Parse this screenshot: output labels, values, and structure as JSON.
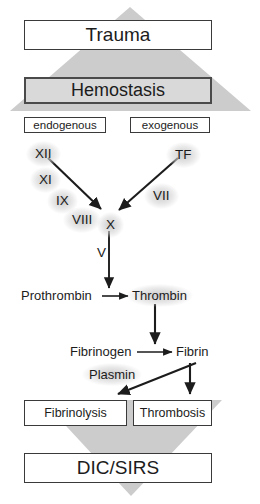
{
  "diagram": {
    "colors": {
      "triangle_fill": "#cccccc",
      "hemostasis_fill": "#d9d9d9",
      "box_border": "#3a3a3a",
      "arrow": "#1c1c1c",
      "text": "#1c1c1c",
      "glow": "#c3c3c3",
      "background": "#ffffff"
    }
  },
  "boxes": {
    "trauma": "Trauma",
    "hemostasis": "Hemostasis",
    "endogenous": "endogenous",
    "exogenous": "exogenous",
    "fibrinolysis": "Fibrinolysis",
    "thrombosis": "Thrombosis",
    "dic_sirs": "DIC/SIRS"
  },
  "factors": {
    "xii": "XII",
    "xi": "XI",
    "ix": "IX",
    "viii": "VIII",
    "tf": "TF",
    "vii": "VII",
    "x": "X",
    "v": "V"
  },
  "proteins": {
    "prothrombin": "Prothrombin",
    "thrombin": "Thrombin",
    "fibrinogen": "Fibrinogen",
    "fibrin": "Fibrin",
    "plasmin": "Plasmin"
  },
  "shapes": {
    "upper_triangle": "upward-gray-triangle",
    "lower_triangle": "downward-gray-triangle"
  },
  "arrows": [
    {
      "name": "intrinsic-path-arrow",
      "from": "XII",
      "to": "X"
    },
    {
      "name": "extrinsic-path-arrow",
      "from": "TF",
      "to": "X"
    },
    {
      "name": "x-to-thrombin-arrow",
      "from": "X",
      "to": "Thrombin",
      "label": "V"
    },
    {
      "name": "prothrombin-to-thrombin-arrow",
      "from": "Prothrombin",
      "to": "Thrombin"
    },
    {
      "name": "thrombin-to-fibrin-arrow",
      "from": "Thrombin",
      "to": "Fibrin"
    },
    {
      "name": "fibrinogen-to-fibrin-arrow",
      "from": "Fibrinogen",
      "to": "Fibrin"
    },
    {
      "name": "plasmin-to-fibrinolysis-arrow",
      "from": "Plasmin",
      "to": "Fibrinolysis"
    },
    {
      "name": "fibrin-to-thrombosis-arrow",
      "from": "Fibrin",
      "to": "Thrombosis"
    }
  ]
}
